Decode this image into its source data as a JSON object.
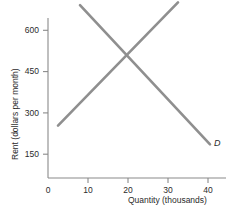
{
  "chart_data": {
    "type": "line",
    "title": "",
    "xlabel": "Quantity (thousands)",
    "ylabel": "Rent (dollars per month)",
    "xlim": [
      0,
      45
    ],
    "ylim": [
      0,
      690
    ],
    "xticks": [
      0,
      10,
      20,
      30,
      40
    ],
    "xtick_labels": [
      "0",
      "10",
      "20",
      "30",
      "40"
    ],
    "yticks": [
      150,
      300,
      450,
      600
    ],
    "ytick_labels": [
      "150",
      "300",
      "450",
      "600"
    ],
    "grid": false,
    "legend_position": "inline-curve-labels",
    "line_color": "#8f8f8f",
    "axis_color": "#8a8a8a",
    "series": [
      {
        "name": "S",
        "label": "S",
        "label_position": {
          "x": 32.6,
          "y": 660
        },
        "points": [
          {
            "x": 2.5,
            "y": 190
          },
          {
            "x": 32.5,
            "y": 638
          }
        ],
        "equation_note": "upward sloping supply curve"
      },
      {
        "name": "D",
        "label": "D",
        "label_position": {
          "x": 41.5,
          "y": 122
        },
        "points": [
          {
            "x": 8.0,
            "y": 628
          },
          {
            "x": 40.5,
            "y": 122
          }
        ],
        "equation_note": "downward sloping demand curve"
      }
    ],
    "equilibrium": {
      "x": 20,
      "y": 450
    }
  }
}
